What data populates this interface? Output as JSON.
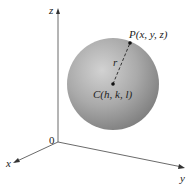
{
  "diagram": {
    "axes": {
      "x_label": "x",
      "y_label": "y",
      "z_label": "z",
      "origin_label": "0"
    },
    "points": {
      "P_label": "P(x, y, z)",
      "C_label": "C(h, k, l)"
    },
    "radius_label": "r",
    "colors": {
      "sphere_light": "#d6d6d6",
      "sphere_dark": "#8a8a8a",
      "axis": "#333333"
    }
  }
}
